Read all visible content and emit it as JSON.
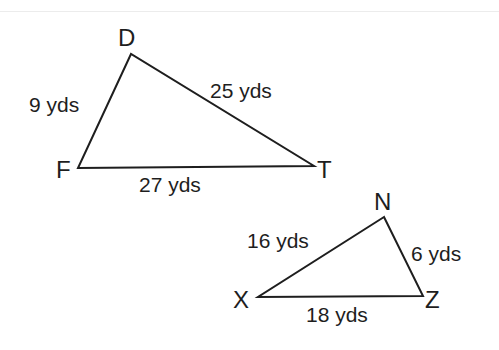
{
  "triangles": [
    {
      "name": "DFT",
      "vertices": {
        "D": "D",
        "F": "F",
        "T": "T"
      },
      "sides": {
        "DF": "9 yds",
        "DT": "25 yds",
        "FT": "27 yds"
      }
    },
    {
      "name": "NXZ",
      "vertices": {
        "N": "N",
        "X": "X",
        "Z": "Z"
      },
      "sides": {
        "XN": "16 yds",
        "NZ": "6 yds",
        "XZ": "18 yds"
      }
    }
  ],
  "colors": {
    "stroke": "#1e1e1e",
    "background": "#ffffff"
  }
}
